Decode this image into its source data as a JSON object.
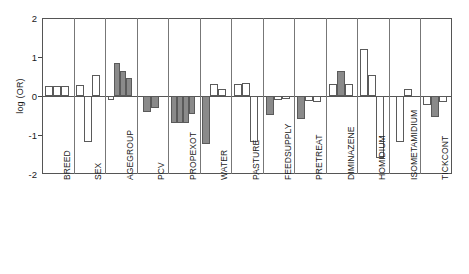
{
  "chart_data": {
    "type": "bar",
    "title": "",
    "subtitle": "",
    "xlabel": "",
    "ylabel": "log (OR)",
    "ylim": [
      -2,
      2
    ],
    "yticks": [
      2,
      1,
      0,
      -1,
      -2
    ],
    "ytick_labels": [
      "2",
      "1",
      "0",
      "-1",
      "-2"
    ],
    "grid": false,
    "legend": "none",
    "zero_reference_line": 0,
    "orientation": "vertical",
    "group_separators": true,
    "series_encoding": {
      "open": "unfilled (white) bar",
      "filled": "shaded (gray) bar",
      "fill_color": "#8a8a8a",
      "open_color": "#ffffff",
      "outline_color": "#5a5a5a"
    },
    "categories": [
      "BREED",
      "SEX",
      "AGEGROUP",
      "PCV",
      "PROPEXOT",
      "WATER",
      "PASTURE",
      "FEEDSUPPLY",
      "PRETREAT",
      "DIMINAZENE",
      "HOMIDIUM",
      "ISOMETAMIDIUM",
      "TICKCONT"
    ],
    "groups": [
      {
        "category": "BREED",
        "bars": [
          {
            "value": 0.26,
            "fill": "open"
          },
          {
            "value": 0.26,
            "fill": "open"
          },
          {
            "value": 0.26,
            "fill": "open"
          }
        ]
      },
      {
        "category": "SEX",
        "bars": [
          {
            "value": 0.27,
            "fill": "open"
          },
          {
            "value": -1.17,
            "fill": "open"
          },
          {
            "value": 0.55,
            "fill": "open"
          }
        ]
      },
      {
        "category": "AGEGROUP",
        "bars": [
          {
            "value": -0.1,
            "fill": "open"
          },
          {
            "value": 0.85,
            "fill": "filled"
          },
          {
            "value": 0.63,
            "fill": "filled"
          },
          {
            "value": 0.46,
            "fill": "filled"
          }
        ]
      },
      {
        "category": "PCV",
        "bars": [
          {
            "value": -0.4,
            "fill": "filled"
          },
          {
            "value": -0.3,
            "fill": "filled"
          }
        ]
      },
      {
        "category": "PROPEXOT",
        "bars": [
          {
            "value": -0.68,
            "fill": "filled"
          },
          {
            "value": -0.68,
            "fill": "filled"
          },
          {
            "value": -0.68,
            "fill": "filled"
          },
          {
            "value": -0.45,
            "fill": "filled"
          }
        ]
      },
      {
        "category": "WATER",
        "bars": [
          {
            "value": -1.22,
            "fill": "filled"
          },
          {
            "value": 0.3,
            "fill": "open"
          },
          {
            "value": 0.18,
            "fill": "open"
          }
        ]
      },
      {
        "category": "PASTURE",
        "bars": [
          {
            "value": 0.3,
            "fill": "open"
          },
          {
            "value": 0.33,
            "fill": "open"
          },
          {
            "value": -1.18,
            "fill": "open"
          }
        ]
      },
      {
        "category": "FEEDSUPPLY",
        "bars": [
          {
            "value": -0.48,
            "fill": "filled"
          },
          {
            "value": -0.1,
            "fill": "open"
          },
          {
            "value": -0.08,
            "fill": "open"
          }
        ]
      },
      {
        "category": "PRETREAT",
        "bars": [
          {
            "value": -0.58,
            "fill": "filled"
          },
          {
            "value": -0.12,
            "fill": "open"
          },
          {
            "value": -0.16,
            "fill": "open"
          }
        ]
      },
      {
        "category": "DIMINAZENE",
        "bars": [
          {
            "value": 0.3,
            "fill": "open"
          },
          {
            "value": 0.65,
            "fill": "filled"
          },
          {
            "value": 0.3,
            "fill": "open"
          }
        ]
      },
      {
        "category": "HOMIDIUM",
        "bars": [
          {
            "value": 1.2,
            "fill": "open"
          },
          {
            "value": 0.55,
            "fill": "open"
          },
          {
            "value": -1.6,
            "fill": "open"
          }
        ]
      },
      {
        "category": "ISOMETAMIDIUM",
        "bars": [
          {
            "value": -1.18,
            "fill": "open"
          },
          {
            "value": 0.18,
            "fill": "open"
          }
        ]
      },
      {
        "category": "TICKCONT",
        "bars": [
          {
            "value": -0.22,
            "fill": "open"
          },
          {
            "value": -0.55,
            "fill": "filled"
          },
          {
            "value": -0.15,
            "fill": "open"
          }
        ]
      }
    ]
  }
}
